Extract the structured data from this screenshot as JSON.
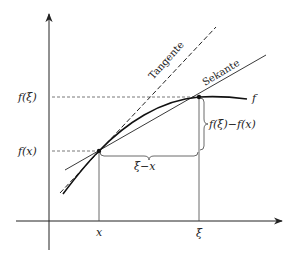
{
  "diagram": {
    "axes": {
      "x_tick_labels": [
        "x",
        "ξ"
      ],
      "y_tick_labels": [
        "f(ξ)",
        "f(x)"
      ]
    },
    "curve_label": "f",
    "lines": {
      "tangent_label": "Tangente",
      "secant_label": "Sekante"
    },
    "braces": {
      "horizontal_label": "ξ−x",
      "vertical_label": "f(ξ)−f(x)"
    },
    "colors": {
      "stroke": "#222222",
      "guide": "#555555",
      "background": "#ffffff"
    }
  }
}
